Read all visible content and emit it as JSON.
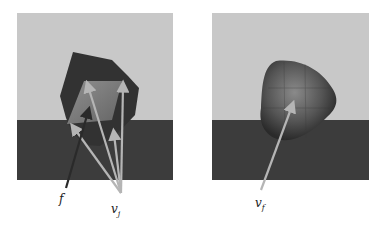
{
  "figure": {
    "left_panel": {
      "labels": {
        "f": "f",
        "vj_base": "v",
        "vj_sub": "j"
      }
    },
    "right_panel": {
      "labels": {
        "vf_base": "v",
        "vf_sub": "f"
      }
    },
    "colors": {
      "sky": "#c8c8c8",
      "floor": "#3c3c3c",
      "object_dark": "#2e2e2e",
      "face_highlight": "#8f8f8f",
      "arrow_light": "#b5b5b5",
      "arrow_dark": "#2a2a2a"
    }
  }
}
